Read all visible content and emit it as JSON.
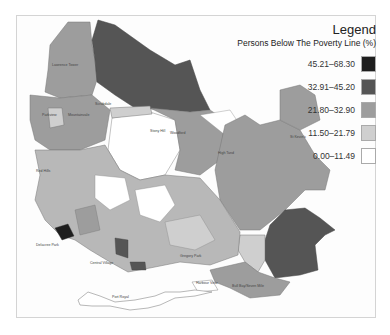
{
  "legend": {
    "title": "Legend",
    "subtitle": "Persons Below The Poverty Line (%)",
    "classes": [
      {
        "range": "45.21–68.30",
        "color": "#1e1e1e"
      },
      {
        "range": "32.91–45.20",
        "color": "#555555"
      },
      {
        "range": "21.80–32.90",
        "color": "#9d9d9d"
      },
      {
        "range": "11.50–21.79",
        "color": "#cfcfcf"
      },
      {
        "range": "0.00–11.49",
        "color": "#ffffff"
      }
    ]
  },
  "map": {
    "region_labels": [
      "Lawrence Tower",
      "Parkview",
      "Mountainvale",
      "Scrubdale",
      "Woodford",
      "St Kevin's",
      "High Tand",
      "Stony Hill",
      "Red Hills",
      "Delacree Park",
      "Central Village",
      "Gregory Park",
      "Bull Bay/Seven Mile",
      "Harbour View",
      "Port Royal",
      "Hope Pastures",
      "Papine"
    ]
  }
}
